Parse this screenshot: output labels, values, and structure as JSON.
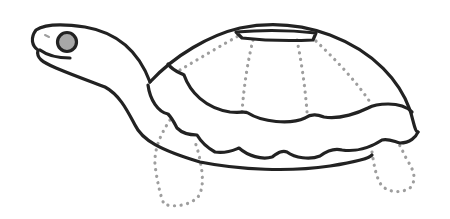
{
  "illustration": {
    "subject": "turtle",
    "style": "line-art",
    "colors": {
      "background": "#ffffff",
      "outline": "#222222",
      "dotted_guides": "#9e9e9e",
      "eye_fill": "#a8a8a8"
    },
    "parts": [
      "head",
      "eye",
      "mouth",
      "nostril",
      "neck",
      "shell-top",
      "shell-plate",
      "shell-scallop-rows",
      "belly",
      "front-leg",
      "back-leg",
      "shell-seams"
    ]
  }
}
